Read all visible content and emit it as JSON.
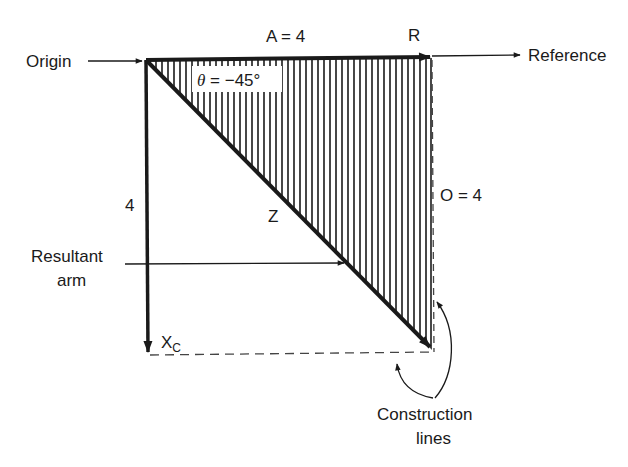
{
  "diagram": {
    "type": "impedance-vector-triangle",
    "labels": {
      "origin": "Origin",
      "reference": "Reference",
      "a_value": "A = 4",
      "r_label": "R",
      "theta_symbol": "θ",
      "theta_value": " = −45°",
      "vertical_value": "4",
      "z_label": "Z",
      "o_value": "O = 4",
      "resultant_line1": "Resultant",
      "resultant_line2": "arm",
      "xc_label": "X",
      "xc_subscript": "C",
      "construction_line1": "Construction",
      "construction_line2": "lines"
    },
    "colors": {
      "ink": "#1a1a1a",
      "background": "#ffffff",
      "dashed": "#555555"
    }
  }
}
